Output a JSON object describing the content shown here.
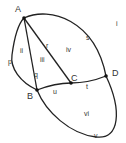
{
  "diagram": {
    "type": "planar-graph",
    "colors": {
      "stroke": "#222222",
      "text": "#333333",
      "background": "#ffffff"
    },
    "vertices": [
      {
        "id": "A",
        "label": "A",
        "x": 24,
        "y": 18,
        "lx": 15,
        "ly": 12
      },
      {
        "id": "B",
        "label": "B",
        "x": 37,
        "y": 90,
        "lx": 27,
        "ly": 99
      },
      {
        "id": "C",
        "label": "C",
        "x": 71,
        "y": 83,
        "lx": 71,
        "ly": 81
      },
      {
        "id": "D",
        "label": "D",
        "x": 106,
        "y": 76,
        "lx": 112,
        "ly": 76
      }
    ],
    "edges": [
      {
        "id": "p",
        "label": "p",
        "from": "A",
        "to": "B",
        "lx": 8,
        "ly": 64
      },
      {
        "id": "q",
        "label": "q",
        "from": "A",
        "to": "B",
        "lx": 34,
        "ly": 77
      },
      {
        "id": "r",
        "label": "r",
        "from": "A",
        "to": "C",
        "lx": 46,
        "ly": 48
      },
      {
        "id": "s",
        "label": "s",
        "from": "A",
        "to": "D",
        "lx": 86,
        "ly": 40
      },
      {
        "id": "t",
        "label": "t",
        "from": "C",
        "to": "D",
        "lx": 86,
        "ly": 89
      },
      {
        "id": "u",
        "label": "u",
        "from": "B",
        "to": "C",
        "lx": 53,
        "ly": 94
      },
      {
        "id": "v",
        "label": "v",
        "from": "B",
        "to": "D",
        "lx": 94,
        "ly": 138
      }
    ],
    "regions": [
      {
        "id": "i",
        "label": "i",
        "lx": 116,
        "ly": 26
      },
      {
        "id": "ii",
        "label": "ii",
        "lx": 20,
        "ly": 53
      },
      {
        "id": "iii",
        "label": "iii",
        "lx": 40,
        "ly": 62
      },
      {
        "id": "iv",
        "label": "iv",
        "lx": 66,
        "ly": 52
      },
      {
        "id": "vi",
        "label": "vi",
        "lx": 84,
        "ly": 116
      }
    ]
  }
}
